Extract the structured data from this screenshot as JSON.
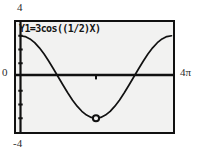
{
  "screen": {
    "kind": "graphing-calculator-plot",
    "background_color": "#ffffff",
    "plot_background_color": "#f2f2f1",
    "border_color": "#111111",
    "curve_color": "#111111"
  },
  "equation_label": "Y1=3cos((1/2)X)",
  "axis_labels": {
    "y_max": "4",
    "y_min": "-4",
    "y_zero": "0",
    "x_max": "4π"
  },
  "chart_data": {
    "type": "line",
    "title": "Y1=3cos((1/2)X)",
    "xlabel": "",
    "ylabel": "",
    "xlim": [
      0,
      12.566370614
    ],
    "ylim": [
      -4,
      4
    ],
    "xtick_labels": [
      "0",
      "4π"
    ],
    "ytick_labels": [
      "-4",
      "0",
      "4"
    ],
    "grid": false,
    "legend": "none",
    "series": [
      {
        "name": "Y1=3cos((1/2)X)",
        "expression": "y = 3*cos(x/2)",
        "amplitude": 3,
        "period": 12.566370614,
        "x": [
          0.0,
          0.3927,
          0.7854,
          1.1781,
          1.5708,
          1.9635,
          2.3562,
          2.7489,
          3.1416,
          3.5343,
          3.927,
          4.3197,
          4.7124,
          5.1051,
          5.4978,
          5.8905,
          6.2832,
          6.6759,
          7.0686,
          7.4613,
          7.854,
          8.2467,
          8.6394,
          9.0321,
          9.4248,
          9.8175,
          10.2102,
          10.6029,
          10.9956,
          11.3883,
          11.781,
          12.1737,
          12.5664
        ],
        "y": [
          3.0,
          2.9427,
          2.7716,
          2.4944,
          2.1213,
          1.6667,
          1.1481,
          0.5853,
          0.0,
          -0.5853,
          -1.1481,
          -1.6667,
          -2.1213,
          -2.4944,
          -2.7716,
          -2.9427,
          -3.0,
          -2.9427,
          -2.7716,
          -2.4944,
          -2.1213,
          -1.6667,
          -1.1481,
          -0.5853,
          0.0,
          0.5853,
          1.1481,
          1.6667,
          2.1213,
          2.4944,
          2.7716,
          2.9427,
          3.0
        ]
      }
    ],
    "markers": [
      {
        "name": "trace-cursor",
        "shape": "circle",
        "x": 6.2832,
        "y": -3.0,
        "label": "minimum"
      }
    ],
    "y_axis_ticks": [
      -3,
      -2,
      -1,
      1,
      2,
      3
    ],
    "x_axis_ticks": [
      6.2832
    ]
  }
}
